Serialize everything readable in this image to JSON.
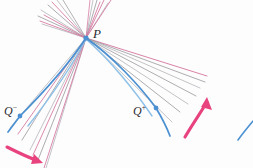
{
  "figure": {
    "type": "optics-caustic-ray-diagram",
    "width": 253,
    "height": 168,
    "background": "#fdfdfd"
  },
  "labels": {
    "P": {
      "text": "P",
      "x": 93,
      "y": 27
    },
    "Q_minus": {
      "base": "Q",
      "sup": "−",
      "x": 4,
      "y": 104
    },
    "Q_plus": {
      "base": "Q",
      "sup": "+",
      "x": 133,
      "y": 104
    }
  },
  "colors": {
    "blue": "#4a90d2",
    "blue_light": "#8dc0e8",
    "pink": "#d4759e",
    "magenta": "#e8437f",
    "gray": "#8a8a90",
    "gray_light": "#a9a9b0",
    "ink": "#2b2b30"
  },
  "points": [
    {
      "name": "P",
      "x": 86,
      "y": 38,
      "color": "#4a90d2",
      "r": 2.6
    },
    {
      "name": "Q-minus",
      "x": 20,
      "y": 116,
      "color": "#4a90d2",
      "r": 2.4
    },
    {
      "name": "Q-plus",
      "x": 156,
      "y": 108,
      "color": "#4a90d2",
      "r": 2.4
    }
  ],
  "ray_fans": {
    "upper_left": {
      "description": "fan of rays radiating up-left from P",
      "origin": [
        86,
        38
      ],
      "rays": [
        {
          "to": [
            42,
            24
          ],
          "color": "#a9a9b0",
          "w": 0.7
        },
        {
          "to": [
            38,
            16
          ],
          "color": "#8a8a90",
          "w": 0.7
        },
        {
          "to": [
            41,
            10
          ],
          "color": "#a9a9b0",
          "w": 0.7
        },
        {
          "to": [
            48,
            5
          ],
          "color": "#8a8a90",
          "w": 0.7
        },
        {
          "to": [
            40,
            21
          ],
          "color": "#d4759e",
          "w": 0.8
        },
        {
          "to": [
            44,
            15
          ],
          "color": "#d4759e",
          "w": 0.8
        },
        {
          "to": [
            52,
            2
          ],
          "color": "#d4759e",
          "w": 0.8
        },
        {
          "to": [
            57,
            0
          ],
          "color": "#a9a9b0",
          "w": 0.7
        }
      ]
    },
    "upper_right": {
      "description": "fan of rays radiating up-right from P",
      "origin": [
        86,
        38
      ],
      "rays": [
        {
          "to": [
            100,
            2
          ],
          "color": "#d4759e",
          "w": 0.8
        },
        {
          "to": [
            104,
            0
          ],
          "color": "#d4759e",
          "w": 0.8
        },
        {
          "to": [
            97,
            0
          ],
          "color": "#8a8a90",
          "w": 0.7
        },
        {
          "to": [
            108,
            3
          ],
          "color": "#a9a9b0",
          "w": 0.7
        },
        {
          "to": [
            111,
            0
          ],
          "color": "#d4759e",
          "w": 0.8
        },
        {
          "to": [
            93,
            0
          ],
          "color": "#a9a9b0",
          "w": 0.7
        }
      ]
    },
    "right": {
      "description": "fan of rays radiating right and down-right from P toward Q-plus",
      "origin": [
        86,
        38
      ],
      "rays": [
        {
          "to": [
            207,
            76
          ],
          "color": "#d4759e",
          "w": 0.8
        },
        {
          "to": [
            205,
            82
          ],
          "color": "#8a8a90",
          "w": 0.7
        },
        {
          "to": [
            200,
            88
          ],
          "color": "#a9a9b0",
          "w": 0.7
        },
        {
          "to": [
            196,
            96
          ],
          "color": "#8a8a90",
          "w": 0.7
        },
        {
          "to": [
            188,
            104
          ],
          "color": "#a9a9b0",
          "w": 0.7
        },
        {
          "to": [
            180,
            112
          ],
          "color": "#8a8a90",
          "w": 0.7
        },
        {
          "to": [
            172,
            122
          ],
          "color": "#a9a9b0",
          "w": 0.7
        }
      ]
    },
    "lower_left": {
      "description": "fan of rays radiating down-left from P toward Q-minus",
      "origin": [
        86,
        38
      ],
      "rays": [
        {
          "to": [
            10,
            128
          ],
          "color": "#a9a9b0",
          "w": 0.7
        },
        {
          "to": [
            22,
            140
          ],
          "color": "#8a8a90",
          "w": 0.7
        },
        {
          "to": [
            30,
            150
          ],
          "color": "#a9a9b0",
          "w": 0.7
        },
        {
          "to": [
            38,
            160
          ],
          "color": "#8a8a90",
          "w": 0.7
        },
        {
          "to": [
            18,
            134
          ],
          "color": "#d4759e",
          "w": 0.8
        },
        {
          "to": [
            33,
            155
          ],
          "color": "#d4759e",
          "w": 0.8
        },
        {
          "to": [
            44,
            168
          ],
          "color": "#d4759e",
          "w": 0.8
        },
        {
          "to": [
            46,
            166
          ],
          "color": "#a9a9b0",
          "w": 0.7
        }
      ]
    }
  },
  "curves": {
    "left_caustic": {
      "description": "blue curved ray from P through Q-minus",
      "color": "#4a90d2",
      "path": "M 86 38 C 70 62 44 92 20 116 L 8 132"
    },
    "left_caustic_2": {
      "description": "secondary blue caustic branch down-left",
      "color": "#8dc0e8",
      "path": "M 86 39 C 72 66 50 98 28 126"
    },
    "right_caustic": {
      "description": "blue curved ray from P through Q-plus",
      "color": "#4a90d2",
      "path": "M 86 38 C 112 56 140 86 156 108 C 162 118 167 128 170 136"
    },
    "right_caustic_2": {
      "description": "secondary blue caustic branch right",
      "color": "#8dc0e8",
      "path": "M 87 40 C 110 60 136 92 152 116"
    },
    "corner_fragment": {
      "description": "small blue curve fragment in lower-right corner",
      "color": "#4a90d2",
      "path": "M 238 138 C 243 132 248 126 252 122"
    }
  },
  "arrows": [
    {
      "name": "motion-arrow-right",
      "description": "pink curved arrow pointing up-right",
      "color": "#e8437f",
      "path": "M 185 136 C 193 124 202 112 208 101",
      "head": [
        208,
        99
      ],
      "angle": -60
    },
    {
      "name": "motion-arrow-bottom-left",
      "description": "pink arrow pointing right at bottom left",
      "color": "#e8437f",
      "path": "M 8 148 C 18 153 28 157 37 160",
      "head": [
        40,
        161
      ],
      "angle": 20
    }
  ]
}
